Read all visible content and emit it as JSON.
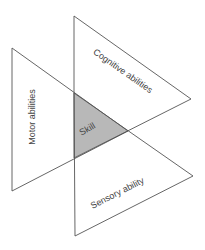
{
  "diagram": {
    "labels": {
      "cognitive": "Cognitive abilities",
      "motor": "Motor abilities",
      "sensory": "Sensory ability",
      "skill": "Skill"
    },
    "colors": {
      "stroke": "#555555",
      "overlap_fill": "#b8b8b8",
      "background": "#ffffff"
    }
  }
}
